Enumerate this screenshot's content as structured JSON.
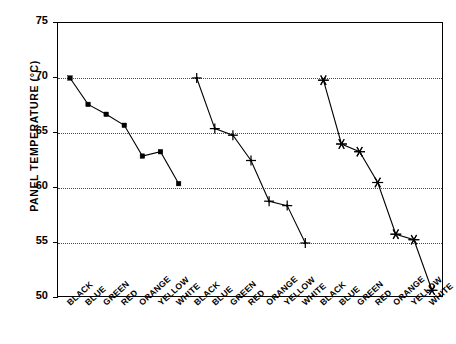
{
  "chart_data": {
    "type": "line",
    "title": "",
    "xlabel": "",
    "ylabel": "PANEL TEMPERATURE (°C)",
    "ylim": [
      50,
      75
    ],
    "yticks": [
      75,
      70,
      65,
      60,
      55,
      50
    ],
    "grid": "horizontal-dotted-at-70-65-60-55",
    "legend": "none",
    "categories": [
      "BLACK",
      "BLUE",
      "GREEN",
      "RED",
      "ORANGE",
      "YELLOW",
      "WHITE"
    ],
    "group_count": 3,
    "x": [
      "BLACK",
      "BLUE",
      "GREEN",
      "RED",
      "ORANGE",
      "YELLOW",
      "WHITE",
      "BLACK",
      "BLUE",
      "GREEN",
      "RED",
      "ORANGE",
      "YELLOW",
      "WHITE",
      "BLACK",
      "BLUE",
      "GREEN",
      "RED",
      "ORANGE",
      "YELLOW",
      "WHITE"
    ],
    "series": [
      {
        "name": "group-1",
        "marker": "filled-square",
        "categories": [
          "BLACK",
          "BLUE",
          "GREEN",
          "RED",
          "ORANGE",
          "YELLOW",
          "WHITE"
        ],
        "values": [
          70.0,
          67.6,
          66.7,
          65.7,
          62.9,
          63.3,
          60.4
        ]
      },
      {
        "name": "group-2",
        "marker": "plus",
        "categories": [
          "BLACK",
          "BLUE",
          "GREEN",
          "RED",
          "ORANGE",
          "YELLOW",
          "WHITE"
        ],
        "values": [
          70.0,
          65.4,
          64.8,
          62.5,
          58.8,
          58.4,
          55.0
        ]
      },
      {
        "name": "group-3",
        "marker": "asterisk",
        "categories": [
          "BLACK",
          "BLUE",
          "GREEN",
          "RED",
          "ORANGE",
          "YELLOW",
          "WHITE"
        ],
        "values": [
          69.8,
          64.0,
          63.3,
          60.5,
          55.8,
          55.3,
          50.7
        ]
      }
    ]
  },
  "axis": {
    "y_title": "PANEL TEMPERATURE (°C)",
    "y_tick_labels": [
      "75",
      "70",
      "65",
      "60",
      "55",
      "50"
    ],
    "x_tick_labels": [
      "BLACK",
      "BLUE",
      "GREEN",
      "RED",
      "ORANGE",
      "YELLOW",
      "WHITE",
      "BLACK",
      "BLUE",
      "GREEN",
      "RED",
      "ORANGE",
      "YELLOW",
      "WHITE",
      "BLACK",
      "BLUE",
      "GREEN",
      "RED",
      "ORANGE",
      "YELLOW",
      "WHITE"
    ]
  },
  "colors": {
    "ink": "#000000",
    "grid": "#4a4a4a",
    "background": "#ffffff"
  }
}
